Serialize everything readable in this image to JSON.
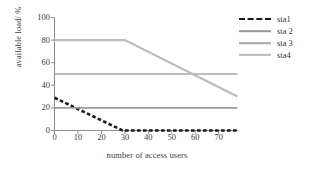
{
  "chart_data": {
    "type": "line",
    "title": "",
    "xlabel": "number of access users",
    "ylabel": "available load/ %",
    "xlim": [
      0,
      78
    ],
    "ylim": [
      0,
      100
    ],
    "xticks": [
      0,
      10,
      20,
      30,
      40,
      50,
      60,
      70
    ],
    "yticks": [
      0,
      20,
      40,
      60,
      80,
      100
    ],
    "grid": false,
    "legend_position": "top-right",
    "series": [
      {
        "name": "sta1",
        "color": "#1a1a1a",
        "style": "dashed",
        "width": 2.6,
        "x": [
          0,
          29,
          78
        ],
        "values": [
          29,
          0,
          0
        ]
      },
      {
        "name": "sta 2",
        "color": "#9a9a9a",
        "style": "solid",
        "width": 1.6,
        "x": [
          0,
          78
        ],
        "values": [
          20,
          20
        ]
      },
      {
        "name": "sta 3",
        "color": "#a8a8a8",
        "style": "solid",
        "width": 1.6,
        "x": [
          0,
          78
        ],
        "values": [
          50,
          50
        ]
      },
      {
        "name": "sta4",
        "color": "#bcbcbc",
        "style": "solid",
        "width": 2.2,
        "x": [
          0,
          30,
          78
        ],
        "values": [
          80,
          80,
          30
        ]
      }
    ]
  },
  "legend": {
    "items": [
      {
        "label": "sta1"
      },
      {
        "label": "sta 2"
      },
      {
        "label": "sta 3"
      },
      {
        "label": "sta4"
      }
    ]
  },
  "axis_labels": {
    "x": "number of access users",
    "y": "available load/ %"
  },
  "ticks": {
    "x": [
      "0",
      "10",
      "20",
      "30",
      "40",
      "50",
      "60",
      "70"
    ],
    "y": [
      "0",
      "20",
      "40",
      "60",
      "80",
      "100"
    ]
  },
  "colors": {
    "axis": "#8c8c8c",
    "text": "#3a3a3a",
    "sta1": "#1a1a1a",
    "sta2": "#9a9a9a",
    "sta3": "#a8a8a8",
    "sta4": "#bcbcbc",
    "background": "#ffffff"
  }
}
